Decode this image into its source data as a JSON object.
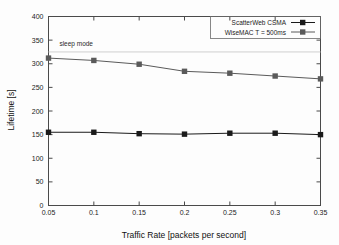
{
  "chart_data": {
    "type": "line",
    "title": "",
    "xlabel": "Traffic Rate [packets per second]",
    "ylabel": "Lifetime [s]",
    "xlim": [
      0.05,
      0.35
    ],
    "ylim": [
      0,
      400
    ],
    "xticks": [
      "0.05",
      "0.1",
      "0.15",
      "0.2",
      "0.25",
      "0.3",
      "0.35"
    ],
    "xtick_values": [
      0.05,
      0.1,
      0.15,
      0.2,
      0.25,
      0.3,
      0.35
    ],
    "yticks": [
      "0",
      "50",
      "100",
      "150",
      "200",
      "250",
      "300",
      "350",
      "400"
    ],
    "ytick_values": [
      0,
      50,
      100,
      150,
      200,
      250,
      300,
      350,
      400
    ],
    "grid": false,
    "legend_position": "top-right",
    "x": [
      0.05,
      0.1,
      0.15,
      0.2,
      0.25,
      0.3,
      0.35
    ],
    "series": [
      {
        "name": "ScatterWeb CSMA",
        "color": "#1a1a1a",
        "marker": "square",
        "values": [
          155,
          155,
          152,
          151,
          153,
          153,
          150
        ]
      },
      {
        "name": "WiseMAC T = 500ms",
        "color": "#5a5a5a",
        "marker": "square",
        "values": [
          312,
          307,
          299,
          284,
          280,
          274,
          268
        ]
      }
    ],
    "annotations": [
      {
        "label": "sleep mode",
        "value": 325,
        "line_color": "#cfcfcf",
        "label_x": 0.062,
        "label_y": 338
      }
    ]
  },
  "legend": {
    "entries": [
      {
        "label": "ScatterWeb CSMA"
      },
      {
        "label": "WiseMAC T = 500ms"
      }
    ]
  },
  "axes": {
    "x_title": "Traffic Rate [packets per second]",
    "y_title": "Lifetime [s]"
  }
}
